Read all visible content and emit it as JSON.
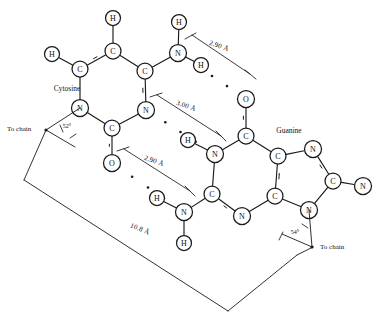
{
  "figure": {
    "kind": "chemical-structure-diagram",
    "background_color": "#ffffff",
    "ink_color": "#1a1a1a",
    "width": 385,
    "height": 322
  },
  "labels": {
    "cytosine": "Cytosine",
    "guanine": "Guanine",
    "to_chain_left": "To chain",
    "to_chain_right": "To  chain"
  },
  "measurements": {
    "hbond_top": "2.90 Å",
    "hbond_middle": "3.00 Å",
    "hbond_bottom": "2.90 Å",
    "pair_width": "10.8 Å"
  },
  "angles": {
    "left": "52°",
    "right": "54°"
  },
  "atoms": [
    {
      "id": "c_h_top",
      "element": "H",
      "x": 113,
      "y": 18,
      "r": 7.5,
      "molecule": "cytosine"
    },
    {
      "id": "c_c5",
      "element": "C",
      "x": 113,
      "y": 51,
      "r": 8.0,
      "molecule": "cytosine"
    },
    {
      "id": "c_h_left",
      "element": "H",
      "x": 52,
      "y": 54,
      "r": 7.5,
      "molecule": "cytosine"
    },
    {
      "id": "c_c6",
      "element": "C",
      "x": 80,
      "y": 69,
      "r": 8.0,
      "molecule": "cytosine"
    },
    {
      "id": "c_c4",
      "element": "C",
      "x": 145,
      "y": 71,
      "r": 8.0,
      "molecule": "cytosine"
    },
    {
      "id": "c_n1",
      "element": "N",
      "x": 80,
      "y": 108,
      "r": 8.5,
      "molecule": "cytosine"
    },
    {
      "id": "c_n3",
      "element": "N",
      "x": 146,
      "y": 110,
      "r": 8.5,
      "molecule": "cytosine"
    },
    {
      "id": "c_c2",
      "element": "C",
      "x": 112,
      "y": 128,
      "r": 8.0,
      "molecule": "cytosine"
    },
    {
      "id": "c_o2",
      "element": "O",
      "x": 112,
      "y": 163,
      "r": 8.5,
      "molecule": "cytosine"
    },
    {
      "id": "c_n4",
      "element": "N",
      "x": 178,
      "y": 53,
      "r": 8.5,
      "molecule": "cytosine"
    },
    {
      "id": "c_n4_h1",
      "element": "H",
      "x": 179,
      "y": 22,
      "r": 7.5,
      "molecule": "cytosine"
    },
    {
      "id": "c_n4_h2",
      "element": "H",
      "x": 201,
      "y": 65,
      "r": 7.5,
      "molecule": "cytosine"
    },
    {
      "id": "g_o6",
      "element": "O",
      "x": 246,
      "y": 99,
      "r": 8.5,
      "molecule": "guanine"
    },
    {
      "id": "g_c6",
      "element": "C",
      "x": 246,
      "y": 136,
      "r": 8.0,
      "molecule": "guanine"
    },
    {
      "id": "g_n1",
      "element": "N",
      "x": 215,
      "y": 154,
      "r": 8.5,
      "molecule": "guanine"
    },
    {
      "id": "g_n1_h",
      "element": "H",
      "x": 188,
      "y": 140,
      "r": 7.5,
      "molecule": "guanine"
    },
    {
      "id": "g_c2",
      "element": "C",
      "x": 212,
      "y": 194,
      "r": 8.0,
      "molecule": "guanine"
    },
    {
      "id": "g_n2",
      "element": "N",
      "x": 184,
      "y": 212,
      "r": 8.5,
      "molecule": "guanine"
    },
    {
      "id": "g_n2_h1",
      "element": "H",
      "x": 157,
      "y": 198,
      "r": 7.5,
      "molecule": "guanine"
    },
    {
      "id": "g_n2_h2",
      "element": "H",
      "x": 184,
      "y": 243,
      "r": 7.5,
      "molecule": "guanine"
    },
    {
      "id": "g_n3",
      "element": "N",
      "x": 242,
      "y": 216,
      "r": 8.5,
      "molecule": "guanine"
    },
    {
      "id": "g_c4",
      "element": "C",
      "x": 275,
      "y": 196,
      "r": 8.0,
      "molecule": "guanine"
    },
    {
      "id": "g_c5",
      "element": "C",
      "x": 278,
      "y": 156,
      "r": 8.0,
      "molecule": "guanine"
    },
    {
      "id": "g_n7",
      "element": "N",
      "x": 313,
      "y": 149,
      "r": 8.5,
      "molecule": "guanine"
    },
    {
      "id": "g_c8",
      "element": "C",
      "x": 333,
      "y": 181,
      "r": 8.0,
      "molecule": "guanine"
    },
    {
      "id": "g_n9",
      "element": "N",
      "x": 309,
      "y": 210,
      "r": 8.5,
      "molecule": "guanine"
    },
    {
      "id": "g_n_term",
      "element": "N",
      "x": 363,
      "y": 186,
      "r": 8.5,
      "molecule": "guanine"
    }
  ],
  "bonds": [
    {
      "from": "c_h_top",
      "to": "c_c5",
      "order": 1
    },
    {
      "from": "c_c5",
      "to": "c_c6",
      "order": 2
    },
    {
      "from": "c_c6",
      "to": "c_h_left",
      "order": 1
    },
    {
      "from": "c_c6",
      "to": "c_n1",
      "order": 1
    },
    {
      "from": "c_c5",
      "to": "c_c4",
      "order": 1
    },
    {
      "from": "c_c4",
      "to": "c_n3",
      "order": 2
    },
    {
      "from": "c_c4",
      "to": "c_n4",
      "order": 1
    },
    {
      "from": "c_n4",
      "to": "c_n4_h1",
      "order": 1
    },
    {
      "from": "c_n4",
      "to": "c_n4_h2",
      "order": 1
    },
    {
      "from": "c_n1",
      "to": "c_c2",
      "order": 1
    },
    {
      "from": "c_c2",
      "to": "c_n3",
      "order": 1
    },
    {
      "from": "c_c2",
      "to": "c_o2",
      "order": 2
    },
    {
      "from": "g_o6",
      "to": "g_c6",
      "order": 2
    },
    {
      "from": "g_c6",
      "to": "g_n1",
      "order": 1
    },
    {
      "from": "g_n1",
      "to": "g_n1_h",
      "order": 1
    },
    {
      "from": "g_n1",
      "to": "g_c2",
      "order": 1
    },
    {
      "from": "g_c2",
      "to": "g_n2",
      "order": 1
    },
    {
      "from": "g_n2",
      "to": "g_n2_h1",
      "order": 1
    },
    {
      "from": "g_n2",
      "to": "g_n2_h2",
      "order": 1
    },
    {
      "from": "g_c2",
      "to": "g_n3",
      "order": 2
    },
    {
      "from": "g_n3",
      "to": "g_c4",
      "order": 1
    },
    {
      "from": "g_c4",
      "to": "g_c5",
      "order": 2
    },
    {
      "from": "g_c5",
      "to": "g_c6",
      "order": 1
    },
    {
      "from": "g_c5",
      "to": "g_n7",
      "order": 1
    },
    {
      "from": "g_n7",
      "to": "g_c8",
      "order": 2
    },
    {
      "from": "g_c8",
      "to": "g_n9",
      "order": 1
    },
    {
      "from": "g_n9",
      "to": "g_c4",
      "order": 1
    },
    {
      "from": "g_c8",
      "to": "g_n_term",
      "order": 1
    }
  ],
  "hydrogen_bonds": [
    {
      "id": "hb_top",
      "from": "c_n4",
      "to": "g_o6",
      "label": "2.90 Å"
    },
    {
      "id": "hb_middle",
      "from": "c_n3",
      "to": "g_n1",
      "label": "3.00 Å"
    },
    {
      "id": "hb_bottom",
      "from": "c_o2",
      "to": "g_n2",
      "label": "2.90 Å"
    }
  ]
}
